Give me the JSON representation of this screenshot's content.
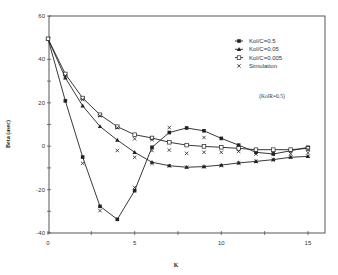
{
  "chart_data": {
    "type": "line",
    "title": "",
    "xlabel": "K",
    "ylabel": "Beta (asec)",
    "xlim": [
      0,
      16
    ],
    "ylim": [
      -40,
      60
    ],
    "xticks": [
      0,
      5,
      10,
      15
    ],
    "yticks": [
      60,
      40,
      20,
      0,
      -20,
      -40
    ],
    "grid": false,
    "legend_position": "top-right",
    "annotation": "(KolR=0.5)",
    "x": [
      0,
      1,
      2,
      3,
      4,
      5,
      6,
      7,
      8,
      9,
      10,
      11,
      12,
      13,
      14,
      15
    ],
    "series": [
      {
        "name": "Kol/C=0.5",
        "marker": "filled-square",
        "values": [
          49.5,
          20.9,
          -5.0,
          -27.7,
          -33.7,
          -20.5,
          -0.5,
          6.3,
          8.4,
          7.1,
          3.6,
          0.5,
          -2.8,
          -3.6,
          -2.1,
          -0.5
        ]
      },
      {
        "name": "Kol/C=0.05",
        "marker": "filled-triangle",
        "values": [
          49.5,
          31.5,
          18.6,
          9.1,
          2.8,
          -2.8,
          -7.4,
          -9.0,
          -9.7,
          -9.4,
          -8.7,
          -7.7,
          -7.0,
          -6.2,
          -5.1,
          -4.7
        ]
      },
      {
        "name": "Kol/C=0.005",
        "marker": "open-square",
        "values": [
          49.5,
          33.3,
          22.2,
          14.5,
          9.0,
          5.3,
          3.8,
          1.8,
          0.5,
          -0.1,
          -0.5,
          -1.0,
          -1.6,
          -1.6,
          -1.6,
          -1.0
        ]
      }
    ],
    "simulation": {
      "name": "Simulation",
      "marker": "x",
      "points": [
        [
          1,
          32.5
        ],
        [
          2,
          21.5
        ],
        [
          2,
          -7.9
        ],
        [
          3,
          14.0
        ],
        [
          3,
          -29.7
        ],
        [
          4,
          8.5
        ],
        [
          4,
          -2.0
        ],
        [
          5,
          3.4
        ],
        [
          5,
          -5.1
        ],
        [
          5,
          -19.0
        ],
        [
          6,
          3.0
        ],
        [
          6,
          -8.0
        ],
        [
          6,
          -2.0
        ],
        [
          7,
          8.6
        ],
        [
          7,
          -1.8
        ],
        [
          7,
          -9.0
        ],
        [
          8,
          -3.3
        ],
        [
          8,
          -9.7
        ],
        [
          9,
          4.0
        ],
        [
          9,
          -2.8
        ],
        [
          9,
          -9.4
        ],
        [
          10,
          -2.8
        ],
        [
          10,
          -9.0
        ],
        [
          11,
          -2.4
        ],
        [
          11,
          -7.7
        ],
        [
          12,
          -3.6
        ],
        [
          12,
          -7.0
        ],
        [
          13,
          -3.2
        ],
        [
          13,
          -6.2
        ],
        [
          14,
          -3.5
        ],
        [
          14,
          -5.0
        ],
        [
          15,
          -1.5
        ],
        [
          15,
          -3.0
        ],
        [
          15,
          -4.7
        ]
      ]
    }
  }
}
